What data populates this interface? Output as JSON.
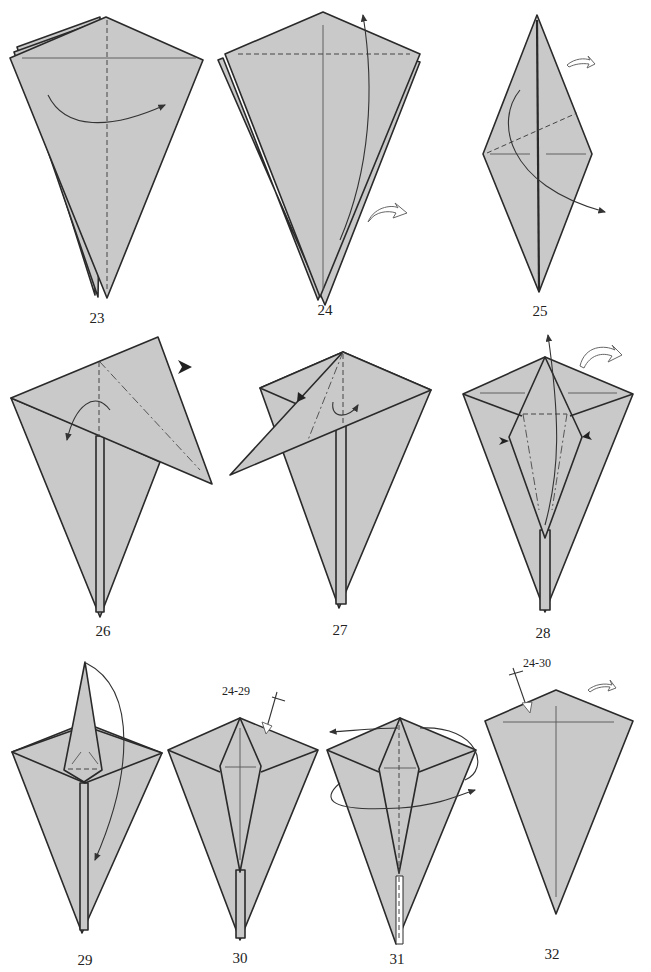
{
  "page": {
    "type": "origami folding instructions",
    "background": "#ffffff",
    "paper_color": "#c9c9c9",
    "line_color": "#2a2a2a"
  },
  "steps": [
    {
      "number": "23",
      "instruction_marks": [
        "valley-fold",
        "fold-arrow"
      ]
    },
    {
      "number": "24",
      "instruction_marks": [
        "valley-fold",
        "fold-arrow",
        "turn-over-arrow"
      ]
    },
    {
      "number": "25",
      "instruction_marks": [
        "valley-fold",
        "fold-arrow",
        "turn-over-arrow"
      ]
    },
    {
      "number": "26",
      "instruction_marks": [
        "mountain-fold",
        "valley-fold",
        "push-arrow",
        "fold-arrow"
      ]
    },
    {
      "number": "27",
      "instruction_marks": [
        "mountain-fold",
        "push-arrow",
        "fold-arrow"
      ]
    },
    {
      "number": "28",
      "instruction_marks": [
        "mountain-fold",
        "valley-fold",
        "push-arrow",
        "fold-arrow",
        "turn-over-arrow"
      ]
    },
    {
      "number": "29",
      "instruction_marks": [
        "valley-fold",
        "fold-arrow"
      ]
    },
    {
      "number": "30",
      "instruction_marks": [
        "repeat-arrow"
      ],
      "repeat_label": "24-29"
    },
    {
      "number": "31",
      "instruction_marks": [
        "valley-fold",
        "wrap-arrow"
      ]
    },
    {
      "number": "32",
      "instruction_marks": [
        "repeat-arrow",
        "turn-over-arrow"
      ],
      "repeat_label": "24-30"
    }
  ]
}
